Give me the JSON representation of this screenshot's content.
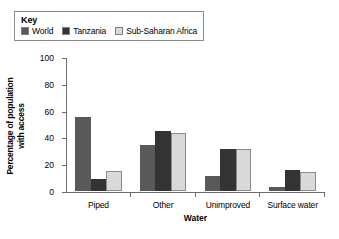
{
  "legend": {
    "title": "Key",
    "entries": [
      {
        "label": "World",
        "color": "#595959"
      },
      {
        "label": "Tanzania",
        "color": "#333333"
      },
      {
        "label": "Sub-Saharan Africa",
        "color": "#d9d9d9"
      }
    ]
  },
  "axes": {
    "ylabel_line1": "Percentage of population",
    "ylabel_line2": "with access",
    "xlabel": "Water",
    "yticks": [
      "100",
      "80",
      "60",
      "40",
      "20",
      "0"
    ]
  },
  "chart_data": {
    "type": "bar",
    "title": "",
    "xlabel": "Water",
    "ylabel": "Percentage of population with access",
    "ylim": [
      0,
      100
    ],
    "ytick_values": [
      0,
      20,
      40,
      60,
      80,
      100
    ],
    "grid": false,
    "legend_position": "above-plot-left",
    "categories": [
      "Piped",
      "Other",
      "Unimproved",
      "Surface water"
    ],
    "series": [
      {
        "name": "World",
        "color": "#595959",
        "values": [
          55,
          34,
          11,
          3
        ]
      },
      {
        "name": "Tanzania",
        "color": "#333333",
        "values": [
          9,
          45,
          31,
          16
        ]
      },
      {
        "name": "Sub-Saharan Africa",
        "color": "#d9d9d9",
        "values": [
          15,
          43,
          31,
          14
        ]
      }
    ]
  }
}
